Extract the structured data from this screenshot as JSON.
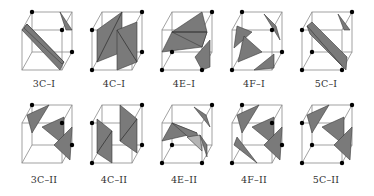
{
  "figure": {
    "rows": [
      {
        "panels": [
          {
            "label": "3C–I"
          },
          {
            "label": "4C–I"
          },
          {
            "label": "4E–I"
          },
          {
            "label": "4F–I"
          },
          {
            "label": "5C–I"
          }
        ]
      },
      {
        "panels": [
          {
            "label": "3C–II"
          },
          {
            "label": "4C–II"
          },
          {
            "label": "4E–II"
          },
          {
            "label": "4F–II"
          },
          {
            "label": "5C–II"
          }
        ]
      }
    ],
    "colors": {
      "surface": "#7a7a7a",
      "surface_light": "#b4b4b4",
      "edge": "#8a8a8a",
      "vertex": "#000000",
      "background": "#ffffff"
    }
  }
}
